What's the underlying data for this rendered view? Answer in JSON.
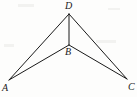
{
  "figure": {
    "type": "geometry-diagram",
    "background_color": "#fdfdfc",
    "stroke_color": "#1a1a1a",
    "stroke_width": 1,
    "canvas": {
      "width": 137,
      "height": 97
    },
    "points": [
      {
        "id": "D",
        "label": "D",
        "x": 69,
        "y": 14,
        "label_x": 65,
        "label_y": 1
      },
      {
        "id": "B",
        "label": "B",
        "x": 69,
        "y": 45,
        "label_x": 65,
        "label_y": 47
      },
      {
        "id": "A",
        "label": "A",
        "x": 9,
        "y": 80,
        "label_x": 2,
        "label_y": 83
      },
      {
        "id": "C",
        "label": "C",
        "x": 127,
        "y": 79,
        "label_x": 128,
        "label_y": 82
      }
    ],
    "segments": [
      {
        "id": "DA",
        "from": "D",
        "to": "A",
        "x1": 69,
        "y1": 14,
        "x2": 9,
        "y2": 80
      },
      {
        "id": "DB",
        "from": "D",
        "to": "B",
        "x1": 69,
        "y1": 14,
        "x2": 69,
        "y2": 45
      },
      {
        "id": "DC",
        "from": "D",
        "to": "C",
        "x1": 69,
        "y1": 14,
        "x2": 127,
        "y2": 79
      },
      {
        "id": "BA",
        "from": "B",
        "to": "A",
        "x1": 69,
        "y1": 45,
        "x2": 9,
        "y2": 80
      },
      {
        "id": "BC",
        "from": "B",
        "to": "C",
        "x1": 69,
        "y1": 45,
        "x2": 127,
        "y2": 79
      }
    ]
  }
}
